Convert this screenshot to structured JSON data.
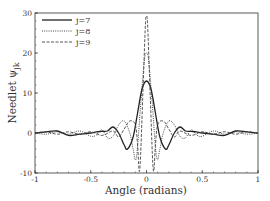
{
  "chart_data": {
    "type": "line",
    "title": "",
    "xlabel": "Angle (radians)",
    "ylabel": "Needlet ψ_jk",
    "ylabel_main": "Needlet ",
    "ylabel_psi": "ψ",
    "ylabel_sub": "jk",
    "xlim": [
      -1,
      1
    ],
    "ylim": [
      -10,
      30
    ],
    "x_ticks": [
      -1,
      -0.5,
      0,
      0.5,
      1
    ],
    "x_tick_labels": [
      "-1",
      "-0.5",
      "0",
      "0.5",
      "1"
    ],
    "y_ticks": [
      -10,
      0,
      10,
      20,
      30
    ],
    "y_tick_labels": [
      "-10",
      "0",
      "10",
      "20",
      "30"
    ],
    "grid": false,
    "legend_position": "upper left",
    "series": [
      {
        "name": "j=7",
        "style": "solid",
        "x": [
          -1,
          -0.9,
          -0.8,
          -0.7,
          -0.6,
          -0.5,
          -0.45,
          -0.4,
          -0.35,
          -0.3,
          -0.25,
          -0.2,
          -0.17,
          -0.12,
          -0.08,
          -0.04,
          0,
          0.04,
          0.08,
          0.12,
          0.17,
          0.2,
          0.25,
          0.3,
          0.35,
          0.4,
          0.45,
          0.5,
          0.6,
          0.7,
          0.8,
          0.9,
          1
        ],
        "y": [
          0,
          0.3,
          0.5,
          -0.6,
          -0.3,
          0,
          0.3,
          0.4,
          0.5,
          1.5,
          0,
          -3,
          -4,
          -1,
          5,
          11,
          13,
          11,
          5,
          -1,
          -4,
          -3,
          0,
          1.5,
          0.5,
          0.4,
          0.3,
          0,
          -0.3,
          -0.6,
          0.5,
          0.3,
          0
        ]
      },
      {
        "name": "j=8",
        "style": "dotted",
        "x": [
          -1,
          -0.9,
          -0.8,
          -0.7,
          -0.6,
          -0.5,
          -0.45,
          -0.4,
          -0.35,
          -0.3,
          -0.25,
          -0.2,
          -0.15,
          -0.12,
          -0.09,
          -0.05,
          -0.02,
          0,
          0.02,
          0.05,
          0.09,
          0.12,
          0.15,
          0.2,
          0.25,
          0.3,
          0.35,
          0.4,
          0.45,
          0.5,
          0.6,
          0.7,
          0.8,
          0.9,
          1
        ],
        "y": [
          0,
          -0.3,
          0.3,
          -0.3,
          0.5,
          -0.8,
          -0.5,
          0.8,
          -1.2,
          -0.8,
          2,
          3,
          0,
          -4,
          -6,
          8,
          18,
          20,
          18,
          8,
          -6,
          -4,
          0,
          3,
          2,
          -0.8,
          -1.2,
          0.8,
          -0.5,
          -0.8,
          0.5,
          -0.3,
          0.3,
          -0.3,
          0
        ]
      },
      {
        "name": "j=9",
        "style": "dashed",
        "x": [
          -1,
          -0.9,
          -0.8,
          -0.7,
          -0.6,
          -0.5,
          -0.4,
          -0.3,
          -0.25,
          -0.2,
          -0.15,
          -0.1,
          -0.08,
          -0.06,
          -0.03,
          -0.01,
          0,
          0.01,
          0.03,
          0.06,
          0.08,
          0.1,
          0.15,
          0.2,
          0.25,
          0.3,
          0.4,
          0.5,
          0.6,
          0.7,
          0.8,
          0.9,
          1
        ],
        "y": [
          0,
          0.3,
          -0.3,
          0.3,
          -0.3,
          0.3,
          -0.6,
          0.5,
          -1,
          1,
          3,
          2,
          -3,
          -9,
          12,
          27,
          29,
          27,
          12,
          -9,
          -3,
          2,
          3,
          1,
          -1,
          0.5,
          -0.6,
          0.3,
          -0.3,
          0.3,
          -0.3,
          0.3,
          0
        ]
      }
    ]
  },
  "colors": {
    "axis": "#333333",
    "j7": "#222222",
    "j8": "#333333",
    "j9": "#444444"
  }
}
